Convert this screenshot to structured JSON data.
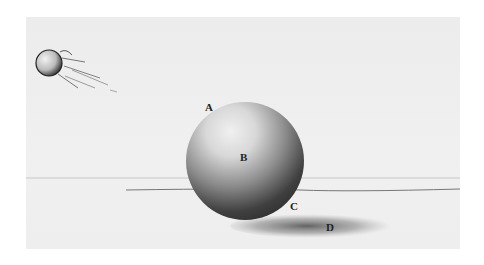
{
  "illustration": {
    "subject": "shaded sphere study with cast shadow and small moving ball sketch",
    "labels": {
      "a": "A",
      "b": "B",
      "c": "C",
      "d": "D"
    },
    "colors": {
      "paper": "#eeeeee",
      "sphere_light": "#e6e6e6",
      "sphere_dark": "#2a2a2a",
      "shadow": "#555555",
      "line": "#7a7a7a"
    }
  }
}
